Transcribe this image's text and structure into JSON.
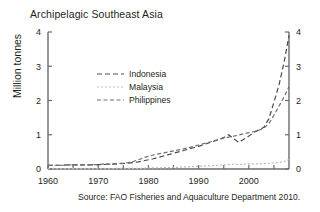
{
  "chart_data": {
    "type": "line",
    "title": "Archipelagic Southeast Asia",
    "xlabel": "",
    "ylabel": "Million tonnes",
    "source": "Source: FAO Fisheries and Aquaculture Department 2010.",
    "xlim": [
      1960,
      2008
    ],
    "ylim": [
      0,
      4
    ],
    "yticks": [
      0,
      1,
      2,
      3,
      4
    ],
    "ytick_labels": [
      "0",
      "1",
      "2",
      "3",
      "4"
    ],
    "xticks": [
      1960,
      1965,
      1970,
      1975,
      1980,
      1985,
      1990,
      1995,
      2000,
      2005
    ],
    "xtick_labels": [
      "1960",
      "",
      "1970",
      "",
      "1980",
      "",
      "1990",
      "",
      "2000",
      ""
    ],
    "xtick_labels_shown": [
      "1960",
      "1970",
      "1980",
      "1990",
      "2000"
    ],
    "grid": false,
    "legend_position": "upper-center-left",
    "right_axis_mirrored": true,
    "right_ytick_labels": [
      "0",
      "1",
      "2",
      "3",
      "4"
    ],
    "x": [
      1960,
      1961,
      1962,
      1963,
      1964,
      1965,
      1966,
      1967,
      1968,
      1969,
      1970,
      1971,
      1972,
      1973,
      1974,
      1975,
      1976,
      1977,
      1978,
      1979,
      1980,
      1981,
      1982,
      1983,
      1984,
      1985,
      1986,
      1987,
      1988,
      1989,
      1990,
      1991,
      1992,
      1993,
      1994,
      1995,
      1996,
      1997,
      1998,
      1999,
      2000,
      2001,
      2002,
      2003,
      2004,
      2005,
      2006,
      2007,
      2008
    ],
    "series": [
      {
        "name": "Indonesia",
        "color": "#4a4a4a",
        "dash": "5,3",
        "values": [
          0.11,
          0.11,
          0.11,
          0.11,
          0.12,
          0.12,
          0.12,
          0.12,
          0.12,
          0.12,
          0.13,
          0.13,
          0.14,
          0.14,
          0.15,
          0.16,
          0.17,
          0.19,
          0.21,
          0.24,
          0.27,
          0.3,
          0.34,
          0.38,
          0.42,
          0.46,
          0.5,
          0.54,
          0.58,
          0.62,
          0.66,
          0.71,
          0.76,
          0.81,
          0.86,
          0.92,
          1.0,
          0.88,
          0.78,
          0.87,
          0.96,
          1.07,
          1.14,
          1.22,
          1.47,
          1.95,
          2.45,
          3.1,
          3.9
        ]
      },
      {
        "name": "Malaysia",
        "color": "#b9b9b9",
        "dash": "2,2",
        "values": [
          0.01,
          0.01,
          0.01,
          0.01,
          0.01,
          0.01,
          0.01,
          0.01,
          0.01,
          0.01,
          0.01,
          0.01,
          0.01,
          0.01,
          0.02,
          0.02,
          0.02,
          0.02,
          0.02,
          0.02,
          0.03,
          0.03,
          0.03,
          0.04,
          0.04,
          0.05,
          0.05,
          0.06,
          0.06,
          0.07,
          0.08,
          0.09,
          0.09,
          0.1,
          0.11,
          0.12,
          0.13,
          0.14,
          0.13,
          0.14,
          0.15,
          0.15,
          0.15,
          0.16,
          0.17,
          0.18,
          0.19,
          0.22,
          0.28
        ]
      },
      {
        "name": "Philippines",
        "color": "#6e6e6e",
        "dash": "4,2.5",
        "values": [
          0.11,
          0.11,
          0.11,
          0.11,
          0.12,
          0.12,
          0.12,
          0.12,
          0.12,
          0.13,
          0.13,
          0.14,
          0.14,
          0.15,
          0.16,
          0.17,
          0.19,
          0.22,
          0.27,
          0.33,
          0.37,
          0.41,
          0.44,
          0.47,
          0.5,
          0.53,
          0.56,
          0.59,
          0.62,
          0.66,
          0.7,
          0.74,
          0.78,
          0.82,
          0.86,
          0.9,
          0.93,
          0.96,
          0.99,
          1.03,
          1.06,
          1.09,
          1.13,
          1.19,
          1.33,
          1.57,
          1.83,
          2.1,
          2.4
        ]
      }
    ]
  }
}
